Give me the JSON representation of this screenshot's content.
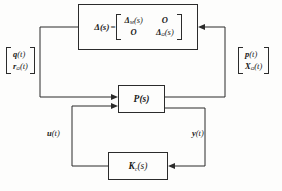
{
  "diagram": {
    "type": "control-block-diagram",
    "blocks": {
      "uncertainty": {
        "name": "delta-block",
        "lead_symbol": "Δ(s)",
        "equals": "=",
        "matrix": {
          "rows": [
            [
              "Δ",
              "O"
            ],
            [
              "O",
              "Δ"
            ]
          ],
          "cell_00_base": "Δ",
          "cell_00_sub": "M",
          "cell_00_arg": "(s)",
          "cell_01": "O",
          "cell_10": "O",
          "cell_11_base": "Δ",
          "cell_11_sub": "Ω",
          "cell_11_arg": "(s)"
        }
      },
      "plant": {
        "name": "plant-block",
        "label": "P(s)"
      },
      "controller": {
        "name": "controller-block",
        "label_base": "K",
        "label_sub": "c",
        "label_arg": "(s)"
      }
    },
    "signals": {
      "left_vector": {
        "top_base": "q",
        "top_arg": "(t)",
        "bottom_base": "r",
        "bottom_sub": "Ω",
        "bottom_arg": "(t)"
      },
      "right_vector": {
        "top_base": "p",
        "top_arg": "(t)",
        "bottom_base": "X",
        "bottom_sub": "Ω",
        "bottom_arg": "(t)"
      },
      "control_input": {
        "base": "u",
        "arg": "(t)"
      },
      "measured_output": {
        "base": "y",
        "arg": "(t)"
      }
    },
    "colors": {
      "line": "#2b2b2b",
      "background": "#fdfdfc",
      "text": "#1a1a1a"
    }
  }
}
